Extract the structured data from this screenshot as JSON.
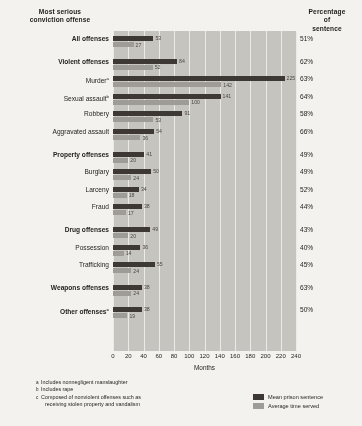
{
  "headers": {
    "left": "Most serious\nconviction offense",
    "right": "Percentage\nof\nsentence"
  },
  "axis": {
    "xlabel": "Months",
    "ticks": [
      "0",
      "20",
      "40",
      "60",
      "80",
      "100",
      "120",
      "140",
      "160",
      "180",
      "200",
      "220",
      "240"
    ]
  },
  "legend": {
    "items": [
      {
        "label": "Mean prison sentence",
        "color": "#3a3530"
      },
      {
        "label": "Average time served",
        "color": "#a09d98"
      }
    ]
  },
  "footnotes": [
    {
      "marker": "a",
      "text": "Includes nonnegligent manslaughter"
    },
    {
      "marker": "b",
      "text": "Includes rape"
    },
    {
      "marker": "c",
      "text": "Composed of nonviolent offenses such as",
      "cont": "receiving stolen property and vandalism"
    }
  ],
  "chart_data": {
    "type": "bar",
    "title": "",
    "xlabel": "Months",
    "ylabel": "Most serious conviction offense",
    "xlim": [
      0,
      240
    ],
    "grid": true,
    "orientation": "horizontal",
    "legend_position": "bottom-right",
    "categories": [
      "All offenses",
      "Violent offenses",
      "Murder",
      "Sexual assault",
      "Robbery",
      "Aggravated assault",
      "Property offenses",
      "Burglary",
      "Larceny",
      "Fraud",
      "Drug offenses",
      "Possession",
      "Trafficking",
      "Weapons offenses",
      "Other offenses"
    ],
    "series": [
      {
        "name": "Mean prison sentence",
        "color": "#3a3530",
        "values": [
          53,
          84,
          225,
          141,
          91,
          54,
          41,
          50,
          34,
          38,
          49,
          36,
          55,
          38,
          38
        ]
      },
      {
        "name": "Average time served",
        "color": "#a09d98",
        "values": [
          27,
          52,
          142,
          100,
          53,
          36,
          20,
          24,
          18,
          17,
          20,
          14,
          24,
          24,
          19
        ]
      }
    ],
    "percentage_of_sentence": [
      "51%",
      "62%",
      "63%",
      "64%",
      "58%",
      "66%",
      "49%",
      "49%",
      "52%",
      "44%",
      "43%",
      "40%",
      "45%",
      "63%",
      "50%"
    ]
  },
  "rows": [
    {
      "label": "All offenses",
      "bold": true,
      "sup": "",
      "dark": 53,
      "light": 27,
      "pct": "51%",
      "group_gap": true
    },
    {
      "label": "Violent offenses",
      "bold": true,
      "sup": "",
      "dark": 84,
      "light": 52,
      "pct": "62%",
      "group_gap": true
    },
    {
      "label": "Murder",
      "bold": false,
      "sup": "a",
      "dark": 225,
      "light": 142,
      "pct": "63%",
      "group_gap": false
    },
    {
      "label": "Sexual assault",
      "bold": false,
      "sup": "b",
      "dark": 141,
      "light": 100,
      "pct": "64%",
      "group_gap": false
    },
    {
      "label": "Robbery",
      "bold": false,
      "sup": "",
      "dark": 91,
      "light": 53,
      "pct": "58%",
      "group_gap": false
    },
    {
      "label": "Aggravated assault",
      "bold": false,
      "sup": "",
      "dark": 54,
      "light": 36,
      "pct": "66%",
      "group_gap": false
    },
    {
      "label": "Property offenses",
      "bold": true,
      "sup": "",
      "dark": 41,
      "light": 20,
      "pct": "49%",
      "group_gap": true
    },
    {
      "label": "Burglary",
      "bold": false,
      "sup": "",
      "dark": 50,
      "light": 24,
      "pct": "49%",
      "group_gap": false
    },
    {
      "label": "Larceny",
      "bold": false,
      "sup": "",
      "dark": 34,
      "light": 18,
      "pct": "52%",
      "group_gap": false
    },
    {
      "label": "Fraud",
      "bold": false,
      "sup": "",
      "dark": 38,
      "light": 17,
      "pct": "44%",
      "group_gap": false
    },
    {
      "label": "Drug offenses",
      "bold": true,
      "sup": "",
      "dark": 49,
      "light": 20,
      "pct": "43%",
      "group_gap": true
    },
    {
      "label": "Possession",
      "bold": false,
      "sup": "",
      "dark": 36,
      "light": 14,
      "pct": "40%",
      "group_gap": false
    },
    {
      "label": "Trafficking",
      "bold": false,
      "sup": "",
      "dark": 55,
      "light": 24,
      "pct": "45%",
      "group_gap": false
    },
    {
      "label": "Weapons offenses",
      "bold": true,
      "sup": "",
      "dark": 38,
      "light": 24,
      "pct": "63%",
      "group_gap": true
    },
    {
      "label": "Other offenses",
      "bold": true,
      "sup": "c",
      "dark": 38,
      "light": 19,
      "pct": "50%",
      "group_gap": true
    }
  ]
}
